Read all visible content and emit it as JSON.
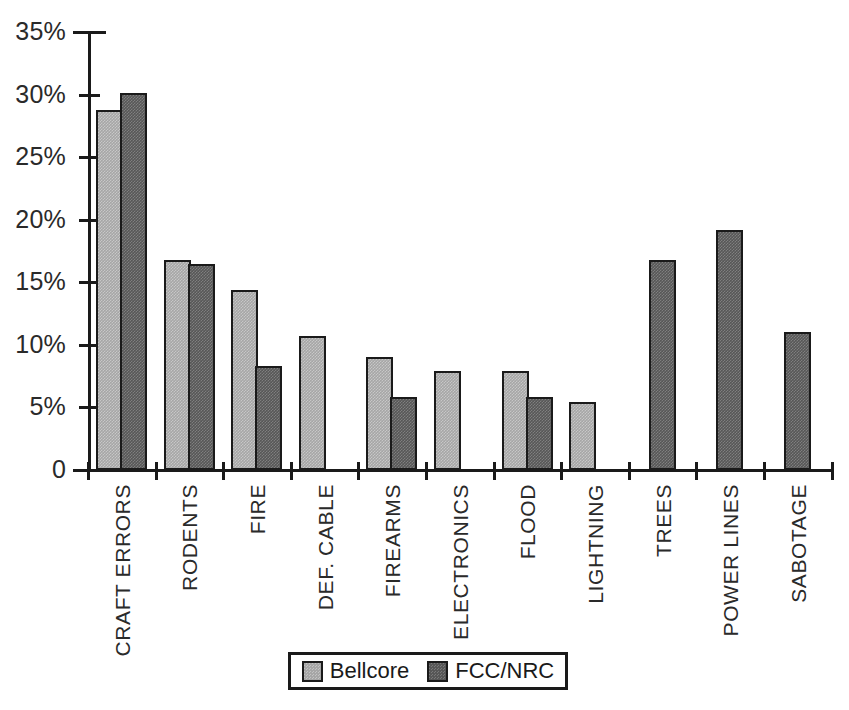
{
  "chart_data": {
    "type": "bar",
    "title": "",
    "xlabel": "",
    "ylabel": "",
    "ylim": [
      0,
      35
    ],
    "grid": false,
    "legend_position": "bottom-center",
    "ytick_labels": [
      "0",
      "5%",
      "10%",
      "15%",
      "20%",
      "25%",
      "30%",
      "35%"
    ],
    "ytick_values": [
      0,
      5,
      10,
      15,
      20,
      25,
      30,
      35
    ],
    "categories": [
      "CRAFT ERRORS",
      "RODENTS",
      "FIRE",
      "DEF. CABLE",
      "FIREARMS",
      "ELECTRONICS",
      "FLOOD",
      "LIGHTNING",
      "TREES",
      "POWER LINES",
      "SABOTAGE"
    ],
    "series": [
      {
        "name": "Bellcore",
        "color": "#a6a6a6",
        "values": [
          28.8,
          16.8,
          14.4,
          10.7,
          9.0,
          7.9,
          7.9,
          5.4,
          null,
          null,
          null
        ]
      },
      {
        "name": "FCC/NRC",
        "color": "#575757",
        "values": [
          30.1,
          16.5,
          8.3,
          null,
          5.8,
          null,
          5.8,
          null,
          16.8,
          19.2,
          11.0
        ]
      }
    ]
  },
  "legend": {
    "entries": [
      {
        "label": "Bellcore",
        "swatch": "bellcore-swatch"
      },
      {
        "label": "FCC/NRC",
        "swatch": "fccnrc-swatch"
      }
    ]
  },
  "colors": {
    "bellcore": "#a6a6a6",
    "fccnrc": "#575757",
    "axis": "#1a1a1a",
    "background": "#ffffff"
  }
}
